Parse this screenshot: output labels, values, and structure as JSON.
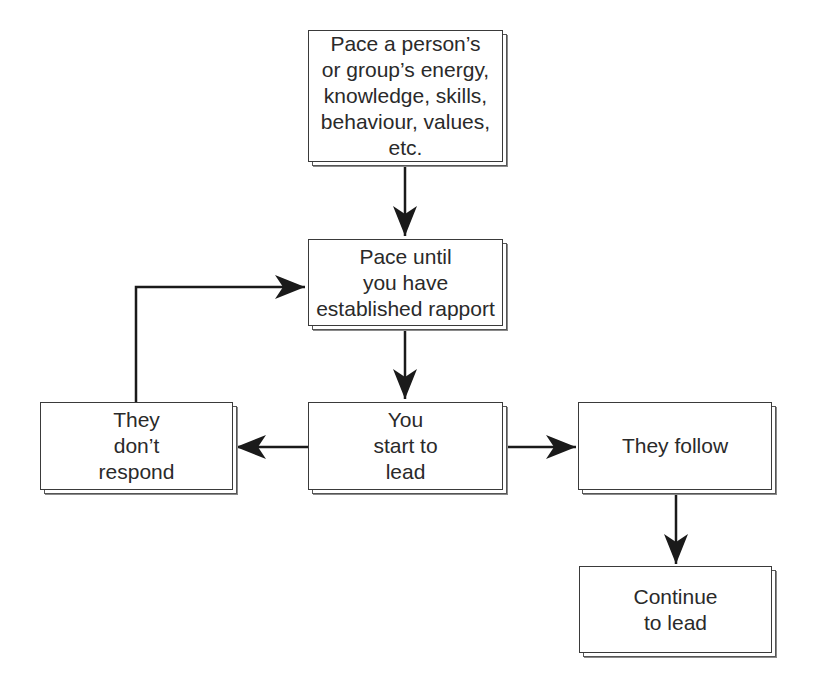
{
  "diagram": {
    "type": "flowchart",
    "nodes": [
      {
        "id": "pace",
        "label": "Pace a person’s\nor group’s energy,\nknowledge, skills,\nbehaviour, values,\netc."
      },
      {
        "id": "rapport",
        "label": "Pace until\nyou have\nestablished rapport"
      },
      {
        "id": "lead",
        "label": "You\nstart to\nlead"
      },
      {
        "id": "no_response",
        "label": "They\ndon’t\nrespond"
      },
      {
        "id": "follow",
        "label": "They follow"
      },
      {
        "id": "continue",
        "label": "Continue\nto lead"
      }
    ],
    "edges": [
      {
        "from": "pace",
        "to": "rapport"
      },
      {
        "from": "rapport",
        "to": "lead"
      },
      {
        "from": "lead",
        "to": "no_response"
      },
      {
        "from": "lead",
        "to": "follow"
      },
      {
        "from": "no_response",
        "to": "rapport"
      },
      {
        "from": "follow",
        "to": "continue"
      }
    ],
    "colors": {
      "line": "#1a1a1a",
      "border": "#3a3a3a",
      "shadow": "#666666",
      "text": "#2a2a2a"
    }
  }
}
